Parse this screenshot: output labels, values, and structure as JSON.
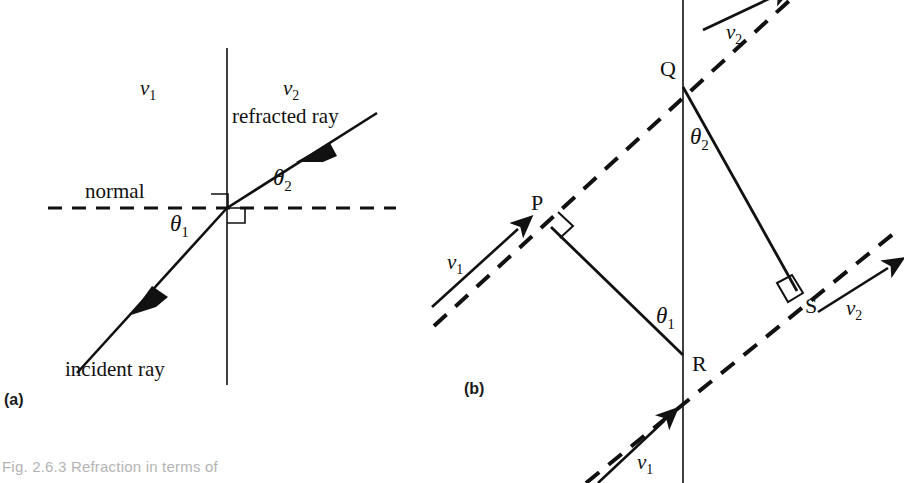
{
  "figure": {
    "caption": "Fig. 2.6.3 Refraction in terms of",
    "panel_a_tag": "(a)",
    "panel_b_tag": "(b)"
  },
  "panel_a": {
    "v1": "v",
    "v1_sub": "1",
    "v2": "v",
    "v2_sub": "2",
    "refracted_ray": "refracted ray",
    "incident_ray": "incident ray",
    "normal": "normal",
    "theta1": "θ",
    "theta1_sub": "1",
    "theta2": "θ",
    "theta2_sub": "2"
  },
  "panel_b": {
    "point_p": "P",
    "point_q": "Q",
    "point_r": "R",
    "point_s": "S",
    "v1_top": "v",
    "v1_top_sub": "1",
    "v1_bottom": "v",
    "v1_bottom_sub": "1",
    "v2_top": "v",
    "v2_top_sub": "2",
    "v2_bottom": "v",
    "v2_bottom_sub": "2",
    "theta1": "θ",
    "theta1_sub": "1",
    "theta2": "θ",
    "theta2_sub": "2"
  },
  "colors": {
    "ink": "#111111",
    "caption": "#b4b4b4",
    "background": "#ffffff"
  }
}
